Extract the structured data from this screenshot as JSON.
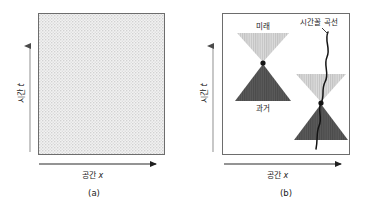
{
  "figure": {
    "panels": [
      {
        "id": "panel-a",
        "caption": "(a)",
        "x_axis_label_word": "공간",
        "x_axis_label_var": "x",
        "y_axis_label_word": "시간",
        "y_axis_label_var": "t",
        "region_fill": "stippled-light-gray"
      },
      {
        "id": "panel-b",
        "caption": "(b)",
        "x_axis_label_word": "공간",
        "x_axis_label_var": "x",
        "y_axis_label_word": "시간",
        "y_axis_label_var": "t",
        "labels": {
          "future": "미래",
          "past": "과거",
          "timelike_curve": "시간꼴 곡선"
        }
      }
    ]
  },
  "colors": {
    "background": "#ffffff",
    "outline": "#6b6b6b",
    "stipple_light": "#e3e3e3",
    "future_cone": "#cfcfcf",
    "past_cone": "#565656",
    "axis_line": "#9a9a9a",
    "curve": "#111111",
    "text": "#1a1a1a"
  }
}
